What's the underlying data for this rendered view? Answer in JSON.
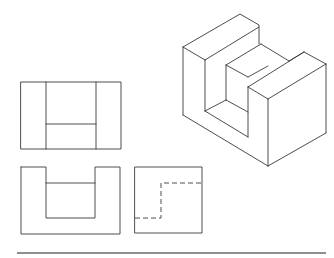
{
  "figure": {
    "type": "orthographic-projection-exercise",
    "colors": {
      "line": "#3a3a3a",
      "rule": "#6a6a6a",
      "background": "#ffffff"
    }
  },
  "views": {
    "isometric": {
      "label": ""
    },
    "top": {
      "label": ""
    },
    "front": {
      "label": ""
    },
    "side": {
      "label": "",
      "hidden_lines": true
    }
  }
}
